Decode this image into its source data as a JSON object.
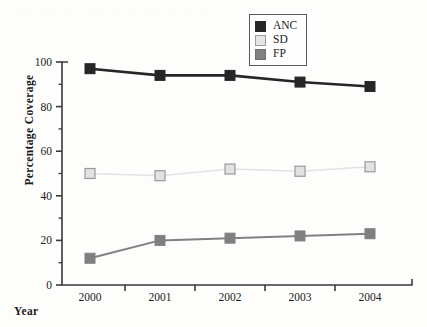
{
  "chart_data": {
    "type": "line",
    "title": "",
    "xlabel": "Year",
    "ylabel": "Percentage Coverage",
    "categories": [
      "2000",
      "2001",
      "2002",
      "2003",
      "2004"
    ],
    "x": [
      2000,
      2001,
      2002,
      2003,
      2004
    ],
    "xlim": [
      1999.6,
      2004.6
    ],
    "ylim": [
      0,
      100
    ],
    "yticks": [
      0,
      20,
      40,
      60,
      80,
      100
    ],
    "yminorticks": [
      10,
      30,
      50,
      70,
      90
    ],
    "grid": false,
    "legend_position": "top-right",
    "series": [
      {
        "name": "ANC",
        "color": "#262626",
        "marker": "square-filled",
        "values": [
          97,
          94,
          94,
          91,
          89
        ]
      },
      {
        "name": "SD",
        "color": "#e2e2e2",
        "edge": "#9a9a9a",
        "marker": "square-open",
        "values": [
          50,
          49,
          52,
          51,
          53
        ]
      },
      {
        "name": "FP",
        "color": "#808080",
        "marker": "square-filled",
        "values": [
          12,
          20,
          21,
          22,
          23
        ]
      }
    ]
  },
  "axis": {
    "ylabel_text": "Percentage Coverage",
    "xlabel_text": "Year",
    "ytick_labels": [
      "0",
      "20",
      "40",
      "60",
      "80",
      "100"
    ],
    "xtick_labels": [
      "2000",
      "2001",
      "2002",
      "2003",
      "2004"
    ]
  },
  "legend": {
    "items": [
      {
        "label": "ANC",
        "swatch": "#262626",
        "border": "#262626"
      },
      {
        "label": "SD",
        "swatch": "#e4e4e4",
        "border": "#9c9c9c"
      },
      {
        "label": "FP",
        "swatch": "#808080",
        "border": "#6e6e6e"
      }
    ]
  },
  "artifacts": {
    "bleed_text": "· ·· · ·· · ··· · ··"
  }
}
